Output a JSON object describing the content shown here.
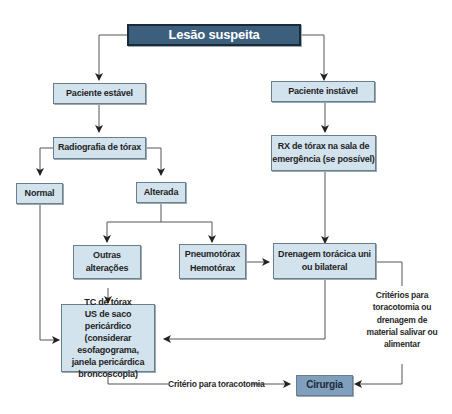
{
  "nodes": {
    "lesao": "Lesão suspeita",
    "estavel": "Paciente estável",
    "instavel": "Paciente instável",
    "radiografia": "Radiografia de tórax",
    "rx_sala": [
      "RX de tórax na sala de",
      "emergência (se possível)"
    ],
    "normal": "Normal",
    "alterada": "Alterada",
    "outras": [
      "Outras",
      "alterações"
    ],
    "pneumo": [
      "Pneumotórax",
      "Hemotórax"
    ],
    "drenagem": [
      "Drenagem torácica uni",
      "ou bilateral"
    ],
    "tc": [
      "TC de tórax",
      "US de saco pericárdico",
      "(considerar esofagograma,",
      "janela pericárdica",
      "broncoscopia)"
    ],
    "cirurgia": "Cirurgia"
  },
  "labels": {
    "criterios": [
      "Critérios para",
      "toracotomia ou",
      "drenagem de",
      "material salivar ou",
      "alimentar"
    ],
    "criterio_toracotomia": "Critério para toracotomia"
  },
  "colors": {
    "top_fill": "#3d5f7e",
    "box_fill": "#d3e3ee",
    "cirurgia_fill": "#7f9fbd",
    "line": "#555555"
  }
}
